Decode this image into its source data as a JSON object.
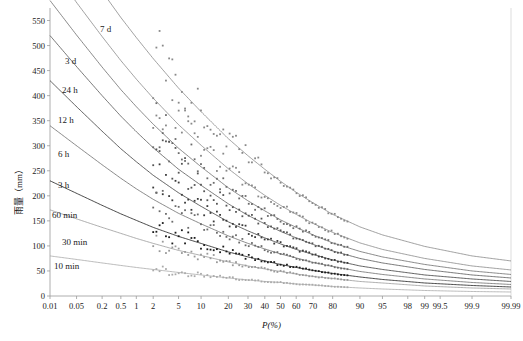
{
  "chart_data": {
    "type": "line",
    "title": "",
    "subtitle": "",
    "xlabel": "P(%)",
    "ylabel": "雨量（mm）",
    "grid": false,
    "legend_position": "inline-curve-labels",
    "x_scale": "probability",
    "xlim": [
      0.01,
      99.99
    ],
    "ylim": [
      0,
      575
    ],
    "y_ticks": [
      0,
      50,
      100,
      150,
      200,
      250,
      300,
      350,
      400,
      450,
      500,
      550
    ],
    "x_ticks": [
      {
        "label": "0.01",
        "value": 0.01
      },
      {
        "label": "0.05",
        "value": 0.05
      },
      {
        "label": "0.2",
        "value": 0.2
      },
      {
        "label": "0.5",
        "value": 0.5
      },
      {
        "label": "1",
        "value": 1
      },
      {
        "label": "2",
        "value": 2
      },
      {
        "label": "5",
        "value": 5
      },
      {
        "label": "10",
        "value": 10
      },
      {
        "label": "20",
        "value": 20
      },
      {
        "label": "30",
        "value": 30
      },
      {
        "label": "40",
        "value": 40
      },
      {
        "label": "50",
        "value": 50
      },
      {
        "label": "60",
        "value": 60
      },
      {
        "label": "70",
        "value": 70
      },
      {
        "label": "80",
        "value": 80
      },
      {
        "label": "90",
        "value": 90
      },
      {
        "label": "95",
        "value": 95
      },
      {
        "label": "98",
        "value": 98
      },
      {
        "label": "99",
        "value": 99
      },
      {
        "label": "99.5",
        "value": 99.5
      },
      {
        "label": "99.9",
        "value": 99.9
      },
      {
        "label": "99.99",
        "value": 99.99
      }
    ],
    "series": [
      {
        "name": "7 d",
        "label": "7 d",
        "color": "#888888",
        "label_x": 100,
        "label_y": 25,
        "p": [
          0.01,
          0.05,
          0.2,
          0.5,
          1,
          2,
          5,
          10,
          20,
          30,
          40,
          50,
          60,
          70,
          80,
          90,
          95,
          99,
          99.9,
          99.99
        ],
        "values": [
          760,
          680,
          608,
          556,
          516,
          474,
          415,
          368,
          314,
          280,
          253,
          229,
          207,
          186,
          163,
          138,
          122,
          99,
          80,
          70
        ]
      },
      {
        "name": "3 d",
        "label": "3 d",
        "color": "#888888",
        "label_x": 65,
        "label_y": 57,
        "p": [
          0.01,
          0.05,
          0.2,
          0.5,
          1,
          2,
          5,
          10,
          20,
          30,
          40,
          50,
          60,
          70,
          80,
          90,
          95,
          99,
          99.9,
          99.99
        ],
        "values": [
          660,
          586,
          518,
          470,
          433,
          395,
          342,
          301,
          254,
          224,
          201,
          181,
          163,
          145,
          127,
          106,
          93,
          75,
          60,
          52
        ]
      },
      {
        "name": "24 h",
        "label": "24 h",
        "color": "#6b6b6b",
        "label_x": 62,
        "label_y": 86,
        "p": [
          0.01,
          0.05,
          0.2,
          0.5,
          1,
          2,
          5,
          10,
          20,
          30,
          40,
          50,
          60,
          70,
          80,
          90,
          95,
          99,
          99.9,
          99.99
        ],
        "values": [
          590,
          521,
          457,
          412,
          378,
          343,
          295,
          258,
          216,
          190,
          170,
          152,
          137,
          122,
          106,
          89,
          78,
          63,
          50,
          43
        ]
      },
      {
        "name": "12 h",
        "label": "12 h",
        "color": "#555555",
        "label_x": 58,
        "label_y": 116,
        "p": [
          0.01,
          0.05,
          0.2,
          0.5,
          1,
          2,
          5,
          10,
          20,
          30,
          40,
          50,
          60,
          70,
          80,
          90,
          95,
          99,
          99.9,
          99.99
        ],
        "values": [
          520,
          458,
          400,
          359,
          328,
          296,
          253,
          221,
          184,
          161,
          144,
          129,
          116,
          103,
          90,
          75,
          66,
          53,
          42,
          36
        ]
      },
      {
        "name": "6 h",
        "label": "6 h",
        "color": "#3a3a3a",
        "label_x": 58,
        "label_y": 150,
        "p": [
          0.01,
          0.05,
          0.2,
          0.5,
          1,
          2,
          5,
          10,
          20,
          30,
          40,
          50,
          60,
          70,
          80,
          90,
          95,
          99,
          99.9,
          99.99
        ],
        "values": [
          430,
          378,
          329,
          294,
          268,
          241,
          206,
          179,
          148,
          130,
          116,
          104,
          93,
          83,
          72,
          60,
          53,
          42,
          34,
          29
        ]
      },
      {
        "name": "3 h",
        "label": "3 h",
        "color": "#6b6b6b",
        "label_x": 58,
        "label_y": 181,
        "p": [
          0.01,
          0.05,
          0.2,
          0.5,
          1,
          2,
          5,
          10,
          20,
          30,
          40,
          50,
          60,
          70,
          80,
          90,
          95,
          99,
          99.9,
          99.99
        ],
        "values": [
          340,
          300,
          262,
          235,
          214,
          193,
          165,
          144,
          120,
          105,
          94,
          84,
          76,
          67,
          59,
          49,
          43,
          34,
          27,
          23
        ]
      },
      {
        "name": "60 min",
        "label": "60 min",
        "color": "#1a1a1a",
        "label_x": 52,
        "label_y": 211,
        "p": [
          0.01,
          0.05,
          0.2,
          0.5,
          1,
          2,
          5,
          10,
          20,
          30,
          40,
          50,
          60,
          70,
          80,
          90,
          95,
          99,
          99.9,
          99.99
        ],
        "values": [
          230,
          205,
          181,
          164,
          151,
          137,
          119,
          105,
          88,
          78,
          70,
          63,
          57,
          51,
          45,
          38,
          33,
          26,
          21,
          18
        ]
      },
      {
        "name": "30 min",
        "label": "30 min",
        "color": "#999999",
        "label_x": 62,
        "label_y": 238,
        "p": [
          0.01,
          0.05,
          0.2,
          0.5,
          1,
          2,
          5,
          10,
          20,
          30,
          40,
          50,
          60,
          70,
          80,
          90,
          95,
          99,
          99.9,
          99.99
        ],
        "values": [
          172,
          154,
          137,
          125,
          115,
          105,
          91,
          81,
          68,
          60,
          54,
          49,
          44,
          39,
          35,
          29,
          26,
          20,
          16,
          14
        ]
      },
      {
        "name": "10 min",
        "label": "10 min",
        "color": "#aaaaaa",
        "label_x": 54,
        "label_y": 262,
        "p": [
          0.01,
          0.05,
          0.2,
          0.5,
          1,
          2,
          5,
          10,
          20,
          30,
          40,
          50,
          60,
          70,
          80,
          90,
          95,
          99,
          99.9,
          99.99
        ],
        "values": [
          80,
          73,
          66,
          61,
          57,
          53,
          47,
          42,
          36,
          32,
          29,
          27,
          24,
          22,
          19,
          16,
          14,
          11,
          9,
          8
        ]
      }
    ],
    "scatter_note": "empirical frequency points plotted along each duration curve, approx P from 2% to 85%"
  }
}
